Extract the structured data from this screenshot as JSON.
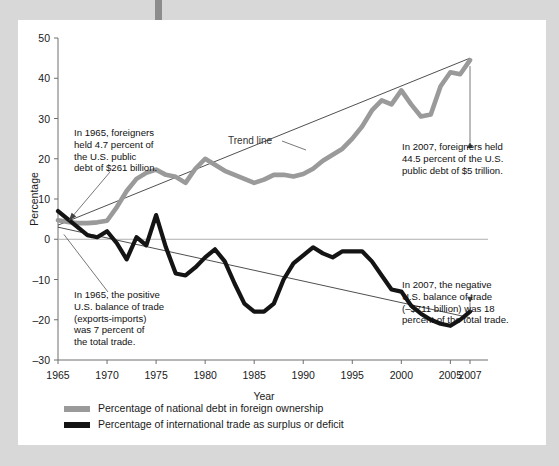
{
  "page": {
    "background_color": "#d8d8d8",
    "card_color": "#ffffff",
    "spine_color": "#8c8c8c"
  },
  "chart_data": {
    "type": "line",
    "title": "",
    "xlabel": "Year",
    "ylabel": "Percentage",
    "xlim": [
      1965,
      2007
    ],
    "ylim": [
      -30,
      50
    ],
    "grid": false,
    "legend_position": "bottom-left",
    "x_ticks": [
      1965,
      1970,
      1975,
      1980,
      1985,
      1990,
      1995,
      2000,
      2005,
      2007
    ],
    "x_tick_labels": [
      "1965",
      "1970",
      "1975",
      "1980",
      "1985",
      "1990",
      "1995",
      "2000",
      "2005",
      "2007"
    ],
    "y_ticks": [
      -30,
      -20,
      -10,
      0,
      10,
      20,
      30,
      40,
      50
    ],
    "y_tick_labels": [
      "-30",
      "-20",
      "-10",
      "0",
      "10",
      "20",
      "30",
      "40",
      "50"
    ],
    "x": [
      1965,
      1966,
      1967,
      1968,
      1969,
      1970,
      1971,
      1972,
      1973,
      1974,
      1975,
      1976,
      1977,
      1978,
      1979,
      1980,
      1981,
      1982,
      1983,
      1984,
      1985,
      1986,
      1987,
      1988,
      1989,
      1990,
      1991,
      1992,
      1993,
      1994,
      1995,
      1996,
      1997,
      1998,
      1999,
      2000,
      2001,
      2002,
      2003,
      2004,
      2005,
      2006,
      2007
    ],
    "series": [
      {
        "name": "Percentage of national debt in foreign ownership",
        "color": "#9a9a9a",
        "values": [
          4.7,
          4.3,
          4.0,
          4.0,
          4.2,
          4.6,
          8.0,
          12.0,
          15.0,
          16.5,
          17.3,
          16.0,
          15.5,
          14.0,
          17.5,
          20.0,
          18.5,
          17.0,
          16.0,
          15.0,
          14.0,
          14.8,
          16.0,
          16.0,
          15.6,
          16.2,
          17.5,
          19.5,
          21.0,
          22.5,
          25.0,
          28.0,
          32.0,
          34.5,
          33.5,
          37.0,
          33.5,
          30.5,
          31.0,
          38.0,
          41.5,
          41.0,
          44.5
        ]
      },
      {
        "name": "Percentage of international trade as surplus or deficit",
        "color": "#141414",
        "values": [
          7.0,
          5.0,
          3.0,
          1.0,
          0.5,
          2.0,
          -1.0,
          -5.0,
          0.5,
          -1.5,
          6.0,
          -2.0,
          -8.5,
          -9.0,
          -7.0,
          -4.5,
          -2.5,
          -5.5,
          -11.0,
          -16.0,
          -18.0,
          -18.0,
          -16.0,
          -10.0,
          -6.0,
          -4.0,
          -2.0,
          -3.5,
          -4.5,
          -3.0,
          -3.0,
          -3.0,
          -5.5,
          -9.0,
          -12.5,
          -13.0,
          -16.5,
          -18.5,
          -20.0,
          -21.0,
          -21.5,
          -20.0,
          -18.0
        ]
      }
    ],
    "trend_lines": [
      {
        "name": "gray-trend",
        "x": [
          1965,
          2007
        ],
        "y": [
          3.5,
          45.0
        ]
      },
      {
        "name": "black-trend",
        "x": [
          1965,
          2007
        ],
        "y": [
          3.0,
          -19.5
        ]
      }
    ],
    "annotations": [
      {
        "name": "annotation-1965-foreign-debt",
        "lines": [
          "In 1965, foreigners",
          "held 4.7 percent of",
          "the U.S. public",
          "debt of $261 billion."
        ],
        "target_year": 1966,
        "target_value": 4.5
      },
      {
        "name": "annotation-2007-foreign-debt",
        "lines": [
          "In 2007, foreigners held",
          "44.5 percent of the U.S.",
          "public debt of $5 trillion."
        ],
        "target_year": 2007,
        "target_value": 44.5
      },
      {
        "name": "annotation-1965-trade-balance",
        "lines": [
          "In 1965, the positive",
          "U.S. balance of trade",
          "(exports-imports)",
          "was 7 percent of",
          "the total trade."
        ],
        "target_year": 1966,
        "target_value": 1.0
      },
      {
        "name": "annotation-2007-trade-balance",
        "lines": [
          "In 2007, the negative",
          "U.S. balance of trade",
          "(–$711 billion) was 18",
          "percent of the total trade."
        ],
        "target_year": 2007,
        "target_value": -18.0
      },
      {
        "name": "trend-line-label",
        "lines": [
          "Trend line"
        ],
        "target_year": 1984,
        "target_value": 24
      }
    ],
    "legend": [
      {
        "label": "Percentage of national debt in foreign ownership",
        "color": "#9a9a9a"
      },
      {
        "label": "Percentage of international trade as surplus or deficit",
        "color": "#141414"
      }
    ]
  }
}
